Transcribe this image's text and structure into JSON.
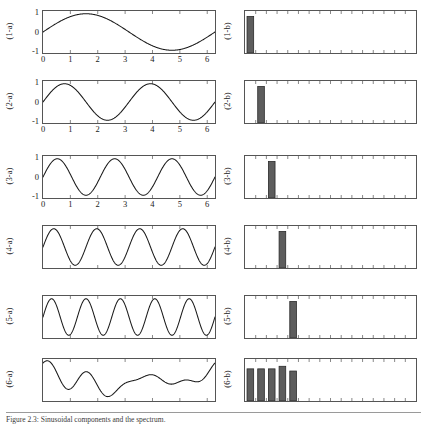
{
  "figure": {
    "caption": "Figure 2.3:  Sinusoidal components and the spectrum.",
    "axis_color": "#555555",
    "curve_color": "#1a1a1a",
    "bar_fill": "#5d5d5d",
    "bar_stroke": "#2b2b2b"
  },
  "left_axis": {
    "y_ticks": [
      "1",
      "0",
      "-1"
    ],
    "y_values": [
      1,
      0,
      -1
    ],
    "x_ticks": [
      "0",
      "1",
      "2",
      "3",
      "4",
      "5",
      "6"
    ],
    "x_values": [
      0,
      1,
      2,
      3,
      4,
      5,
      6
    ],
    "xlim": [
      0,
      6.2832
    ],
    "ylim": [
      -1.15,
      1.15
    ]
  },
  "right_axis": {
    "xlim": [
      0,
      16
    ],
    "ylim": [
      0,
      1.15
    ],
    "n_ticks": 16,
    "tick_labels": []
  },
  "rows": [
    {
      "left_label": "(1-a)",
      "right_label": "(1-b)",
      "show_axis_labels": true,
      "chart_data": {
        "type": "line",
        "title": "(1-a)",
        "xlabel": "",
        "ylabel": "",
        "xlim": [
          0,
          6.2832
        ],
        "ylim": [
          -1.15,
          1.15
        ],
        "grid": false,
        "series": [
          {
            "name": "sin(1x)",
            "frequency": 1,
            "amplitude": 1.0,
            "phase": 0
          }
        ]
      },
      "spectrum_data": {
        "type": "bar",
        "title": "(1-b)",
        "categories": [
          1,
          2,
          3,
          4,
          5,
          6,
          7,
          8,
          9,
          10,
          11,
          12,
          13,
          14,
          15,
          16
        ],
        "values": [
          1.0,
          0,
          0,
          0,
          0,
          0,
          0,
          0,
          0,
          0,
          0,
          0,
          0,
          0,
          0,
          0
        ],
        "xlim": [
          0,
          16
        ],
        "ylim": [
          0,
          1.15
        ]
      }
    },
    {
      "left_label": "(2-a)",
      "right_label": "(2-b)",
      "show_axis_labels": true,
      "chart_data": {
        "type": "line",
        "title": "(2-a)",
        "xlabel": "",
        "ylabel": "",
        "xlim": [
          0,
          6.2832
        ],
        "ylim": [
          -1.15,
          1.15
        ],
        "grid": false,
        "series": [
          {
            "name": "sin(2x)",
            "frequency": 2,
            "amplitude": 1.0,
            "phase": 0
          }
        ]
      },
      "spectrum_data": {
        "type": "bar",
        "title": "(2-b)",
        "categories": [
          1,
          2,
          3,
          4,
          5,
          6,
          7,
          8,
          9,
          10,
          11,
          12,
          13,
          14,
          15,
          16
        ],
        "values": [
          0,
          1.0,
          0,
          0,
          0,
          0,
          0,
          0,
          0,
          0,
          0,
          0,
          0,
          0,
          0,
          0
        ],
        "xlim": [
          0,
          16
        ],
        "ylim": [
          0,
          1.15
        ]
      }
    },
    {
      "left_label": "(3-a)",
      "right_label": "(3-b)",
      "show_axis_labels": true,
      "chart_data": {
        "type": "line",
        "title": "(3-a)",
        "xlabel": "",
        "ylabel": "",
        "xlim": [
          0,
          6.2832
        ],
        "ylim": [
          -1.15,
          1.15
        ],
        "grid": false,
        "series": [
          {
            "name": "sin(3x)",
            "frequency": 3,
            "amplitude": 1.0,
            "phase": 0
          }
        ]
      },
      "spectrum_data": {
        "type": "bar",
        "title": "(3-b)",
        "categories": [
          1,
          2,
          3,
          4,
          5,
          6,
          7,
          8,
          9,
          10,
          11,
          12,
          13,
          14,
          15,
          16
        ],
        "values": [
          0,
          0,
          1.0,
          0,
          0,
          0,
          0,
          0,
          0,
          0,
          0,
          0,
          0,
          0,
          0,
          0
        ],
        "xlim": [
          0,
          16
        ],
        "ylim": [
          0,
          1.15
        ]
      }
    },
    {
      "left_label": "(4-a)",
      "right_label": "(4-b)",
      "show_axis_labels": false,
      "chart_data": {
        "type": "line",
        "title": "(4-a)",
        "xlabel": "",
        "ylabel": "",
        "xlim": [
          0,
          6.2832
        ],
        "ylim": [
          -1.15,
          1.15
        ],
        "grid": false,
        "series": [
          {
            "name": "sin(4x)",
            "frequency": 4,
            "amplitude": 1.0,
            "phase": 0
          }
        ]
      },
      "spectrum_data": {
        "type": "bar",
        "title": "(4-b)",
        "categories": [
          1,
          2,
          3,
          4,
          5,
          6,
          7,
          8,
          9,
          10,
          11,
          12,
          13,
          14,
          15,
          16
        ],
        "values": [
          0,
          0,
          0,
          1.0,
          0,
          0,
          0,
          0,
          0,
          0,
          0,
          0,
          0,
          0,
          0,
          0
        ],
        "xlim": [
          0,
          16
        ],
        "ylim": [
          0,
          1.15
        ]
      }
    },
    {
      "left_label": "(5-a)",
      "right_label": "(5-b)",
      "show_axis_labels": false,
      "chart_data": {
        "type": "line",
        "title": "(5-a)",
        "xlabel": "",
        "ylabel": "",
        "xlim": [
          0,
          6.2832
        ],
        "ylim": [
          -1.15,
          1.15
        ],
        "grid": false,
        "series": [
          {
            "name": "sin(5x)",
            "frequency": 5,
            "amplitude": 1.0,
            "phase": 0
          }
        ]
      },
      "spectrum_data": {
        "type": "bar",
        "title": "(5-b)",
        "categories": [
          1,
          2,
          3,
          4,
          5,
          6,
          7,
          8,
          9,
          10,
          11,
          12,
          13,
          14,
          15,
          16
        ],
        "values": [
          0,
          0,
          0,
          0,
          1.0,
          0,
          0,
          0,
          0,
          0,
          0,
          0,
          0,
          0,
          0,
          0
        ],
        "xlim": [
          0,
          16
        ],
        "ylim": [
          0,
          1.15
        ]
      }
    },
    {
      "left_label": "(6-a)",
      "right_label": "(6-b)",
      "show_axis_labels": false,
      "chart_data": {
        "type": "line",
        "title": "(6-a)",
        "xlabel": "",
        "ylabel": "",
        "xlim": [
          0,
          6.2832
        ],
        "ylim": [
          -1.15,
          1.15
        ],
        "grid": false,
        "series": [
          {
            "name": "sum of harmonics 1-5",
            "frequency": 0,
            "amplitude": 1.0,
            "phase": 0,
            "components": [
              {
                "frequency": 1,
                "amplitude": 0.3,
                "phase": 1.9
              },
              {
                "frequency": 2,
                "amplitude": 0.27,
                "phase": 0.6
              },
              {
                "frequency": 3,
                "amplitude": 0.26,
                "phase": 2.4
              },
              {
                "frequency": 4,
                "amplitude": 0.3,
                "phase": 1.1
              },
              {
                "frequency": 5,
                "amplitude": 0.25,
                "phase": 0.2
              }
            ]
          }
        ]
      },
      "spectrum_data": {
        "type": "bar",
        "title": "(6-b)",
        "categories": [
          1,
          2,
          3,
          4,
          5,
          6,
          7,
          8,
          9,
          10,
          11,
          12,
          13,
          14,
          15,
          16
        ],
        "values": [
          0.88,
          0.88,
          0.88,
          0.95,
          0.82,
          0,
          0,
          0,
          0,
          0,
          0,
          0,
          0,
          0,
          0,
          0
        ],
        "xlim": [
          0,
          16
        ],
        "ylim": [
          0,
          1.15
        ]
      }
    }
  ]
}
